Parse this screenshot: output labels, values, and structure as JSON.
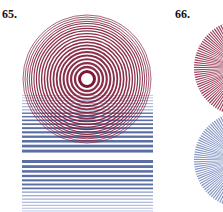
{
  "figures": [
    {
      "number": "65.",
      "description": "Concentric circles over horizontal line grating (moiré)",
      "circle": {
        "cx": 87,
        "cy": 79,
        "r": 65,
        "color": "#7d1836",
        "inner_white_r": 6,
        "ring_count": 22
      },
      "grating": {
        "x": 22,
        "width": 131,
        "top": 95,
        "gap_top": 151,
        "gap_bottom": 160,
        "bottom": 212,
        "color": "#3f5694"
      }
    },
    {
      "number": "66.",
      "description": "Two overlapping radial-line circles (red over blue)",
      "top_fan": {
        "cx": 242,
        "cy": 68,
        "r": 48,
        "color": "#8a1a3c",
        "spokes": 120
      },
      "bottom_fan": {
        "cx": 242,
        "cy": 160,
        "r": 48,
        "color": "#6f82b8",
        "spokes": 120
      }
    }
  ],
  "colors": {
    "maroon": "#7d1836",
    "blue": "#3f5694",
    "light_blue": "#8fa0cc",
    "background": "#ffffff",
    "label": "#111111"
  }
}
